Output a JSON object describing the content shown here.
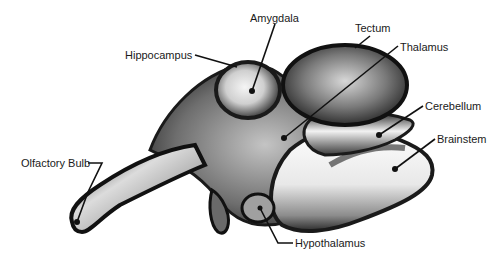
{
  "diagram": {
    "type": "anatomical-illustration",
    "colors": {
      "ink": "#111111",
      "background": "#ffffff",
      "shade_dark": "#2a2a2a",
      "shade_mid": "#8a8a8a",
      "shade_light": "#e6e6e6"
    },
    "labels": [
      {
        "id": "amygdala",
        "text": "Amygdala",
        "x": 250,
        "y": 12,
        "point": [
          252,
          91
        ]
      },
      {
        "id": "tectum",
        "text": "Tectum",
        "x": 355,
        "y": 22,
        "point": [
          355,
          48
        ]
      },
      {
        "id": "hippocampus",
        "text": "Hippocampus",
        "x": 125,
        "y": 49,
        "point": [
          237,
          67
        ]
      },
      {
        "id": "thalamus",
        "text": "Thalamus",
        "x": 400,
        "y": 41,
        "point": [
          284,
          138
        ]
      },
      {
        "id": "cerebellum",
        "text": "Cerebellum",
        "x": 425,
        "y": 100,
        "point": [
          379,
          135
        ]
      },
      {
        "id": "brainstem",
        "text": "Brainstem",
        "x": 437,
        "y": 133,
        "point": [
          395,
          169
        ]
      },
      {
        "id": "olfactory-bulb",
        "text": "Olfactory Bulb",
        "x": 21,
        "y": 157,
        "point": [
          77,
          222
        ]
      },
      {
        "id": "hypothalamus",
        "text": "Hypothalamus",
        "x": 295,
        "y": 237,
        "point": [
          260,
          208
        ]
      }
    ]
  }
}
